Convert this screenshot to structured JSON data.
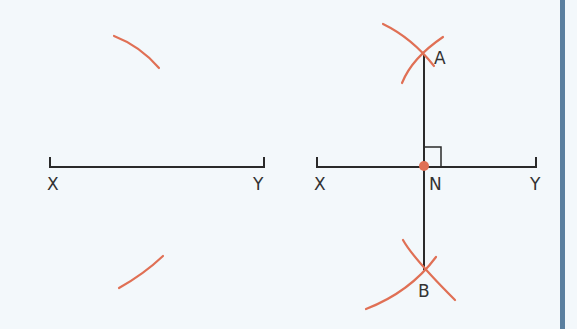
{
  "colors": {
    "background": "#f3f8fb",
    "line": "#2a2a2a",
    "arc": "#e07055",
    "point": "#e07055",
    "edge_bar": "#5a7f9f"
  },
  "left_figure": {
    "labels": {
      "start": "X",
      "end": "Y"
    }
  },
  "right_figure": {
    "labels": {
      "start": "X",
      "end": "Y",
      "top_intersection": "A",
      "bottom_intersection": "B",
      "midpoint": "N"
    }
  }
}
